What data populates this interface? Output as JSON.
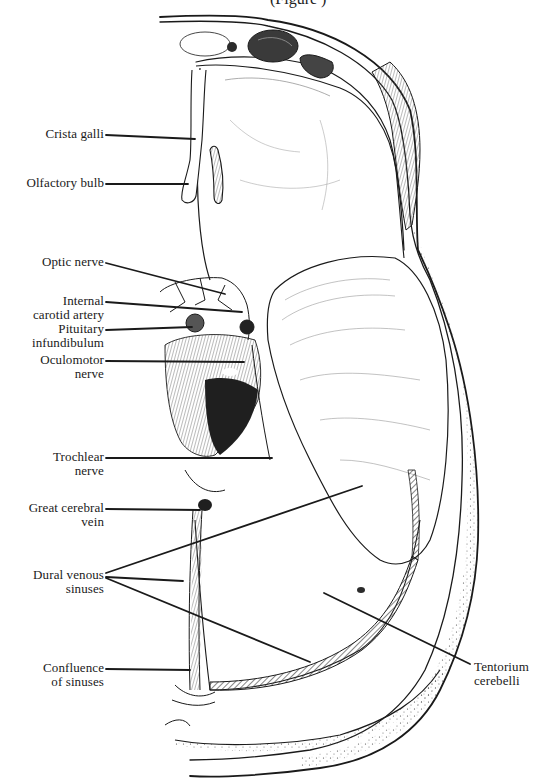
{
  "figure": {
    "caption_fragment": "(Figure  )",
    "ink_color": "#1a1a1a",
    "background": "#ffffff",
    "fill_dark": "#2b2b2b",
    "fill_hatch": "#6e6e6e"
  },
  "labels": {
    "crista_galli": {
      "line1": "Crista galli",
      "line2": ""
    },
    "olfactory_bulb": {
      "line1": "Olfactory bulb",
      "line2": ""
    },
    "optic_nerve": {
      "line1": "Optic nerve",
      "line2": ""
    },
    "internal_carotid_artery": {
      "line1": "Internal",
      "line2": "carotid artery"
    },
    "pituitary_infundibulum": {
      "line1": "Pituitary",
      "line2": "infundibulum"
    },
    "oculomotor_nerve": {
      "line1": "Oculomotor",
      "line2": "nerve"
    },
    "trochlear_nerve": {
      "line1": "Trochlear",
      "line2": "nerve"
    },
    "great_cerebral_vein": {
      "line1": "Great cerebral",
      "line2": "vein"
    },
    "dural_venous_sinuses": {
      "line1": "Dural venous",
      "line2": "sinuses"
    },
    "confluence_of_sinuses": {
      "line1": "Confluence",
      "line2": "of sinuses"
    },
    "tentorium_cerebelli": {
      "line1": "Tentorium",
      "line2": "cerebelli"
    }
  }
}
